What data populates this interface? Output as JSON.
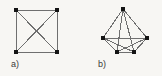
{
  "figure": {
    "background_color": "#f7f6f3",
    "edge_color": "#6f6f6f",
    "vertex_color": "#141414",
    "caption_color": "#3a3a3a",
    "vertex_size": 4,
    "edge_width": 1
  },
  "panels": [
    {
      "id": "a",
      "caption": "a)",
      "description": "complete graph on four vertices drawn as a square with both diagonals",
      "vertex_count": 4,
      "edge_count": 6,
      "vertices": [
        {
          "name": "v1",
          "label": "top-left",
          "x": 16,
          "y": 10
        },
        {
          "name": "v2",
          "label": "top-right",
          "x": 57,
          "y": 10
        },
        {
          "name": "v3",
          "label": "bottom-right",
          "x": 57,
          "y": 52
        },
        {
          "name": "v4",
          "label": "bottom-left",
          "x": 16,
          "y": 52
        }
      ],
      "edges": [
        {
          "from": 0,
          "to": 1,
          "kind": "side"
        },
        {
          "from": 1,
          "to": 2,
          "kind": "side"
        },
        {
          "from": 2,
          "to": 3,
          "kind": "side"
        },
        {
          "from": 3,
          "to": 0,
          "kind": "side"
        },
        {
          "from": 0,
          "to": 2,
          "kind": "diagonal"
        },
        {
          "from": 1,
          "to": 3,
          "kind": "diagonal"
        }
      ]
    },
    {
      "id": "b",
      "caption": "b)",
      "description": "complete graph on five vertices drawn as an apex above a quadrilateral base",
      "vertex_count": 5,
      "edge_count": 10,
      "vertices": [
        {
          "name": "v1",
          "label": "apex",
          "x": 42,
          "y": 9
        },
        {
          "name": "v2",
          "label": "left",
          "x": 22,
          "y": 38
        },
        {
          "name": "v3",
          "label": "right",
          "x": 66,
          "y": 38
        },
        {
          "name": "v4",
          "label": "bottom-left",
          "x": 36,
          "y": 52
        },
        {
          "name": "v5",
          "label": "bottom-right",
          "x": 53,
          "y": 52
        }
      ],
      "edges": [
        {
          "from": 0,
          "to": 1,
          "kind": "outer"
        },
        {
          "from": 0,
          "to": 2,
          "kind": "outer"
        },
        {
          "from": 0,
          "to": 3,
          "kind": "inner"
        },
        {
          "from": 0,
          "to": 4,
          "kind": "inner"
        },
        {
          "from": 1,
          "to": 2,
          "kind": "inner"
        },
        {
          "from": 1,
          "to": 3,
          "kind": "outer"
        },
        {
          "from": 1,
          "to": 4,
          "kind": "inner"
        },
        {
          "from": 2,
          "to": 3,
          "kind": "inner"
        },
        {
          "from": 2,
          "to": 4,
          "kind": "outer"
        },
        {
          "from": 3,
          "to": 4,
          "kind": "outer"
        }
      ]
    }
  ]
}
